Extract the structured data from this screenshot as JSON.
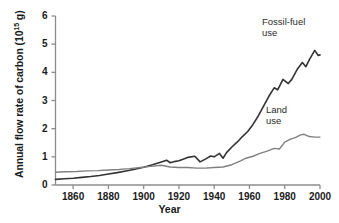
{
  "chart_data": {
    "type": "line",
    "title": "",
    "xlabel": "Year",
    "ylabel": "Annual flow rate of carbon (10",
    "ylabel_exponent": "15",
    "ylabel_suffix": " g)",
    "xlim": [
      1850,
      2000
    ],
    "ylim": [
      0,
      6
    ],
    "grid": false,
    "legend_position": "inline-annotations",
    "xticks": [
      1860,
      1880,
      1900,
      1920,
      1940,
      1960,
      1980,
      2000
    ],
    "xtick_labels": [
      "1860",
      "1880",
      "1900",
      "1920",
      "1940",
      "1960",
      "1980",
      "2000"
    ],
    "yticks": [
      0,
      1,
      2,
      3,
      4,
      5,
      6
    ],
    "ytick_labels": [
      "0",
      "1",
      "2",
      "3",
      "4",
      "5",
      "6"
    ],
    "series": [
      {
        "name": "Fossil-fuel use",
        "color": "#333333",
        "annotation": "Fossil-fuel\nuse",
        "x": [
          1850,
          1855,
          1860,
          1865,
          1870,
          1875,
          1880,
          1885,
          1890,
          1895,
          1900,
          1905,
          1910,
          1913,
          1915,
          1918,
          1920,
          1925,
          1929,
          1932,
          1935,
          1938,
          1940,
          1943,
          1945,
          1947,
          1950,
          1953,
          1956,
          1959,
          1962,
          1965,
          1968,
          1971,
          1974,
          1976,
          1979,
          1982,
          1984,
          1987,
          1990,
          1992,
          1994,
          1997,
          1999,
          2000
        ],
        "y": [
          0.2,
          0.22,
          0.24,
          0.27,
          0.3,
          0.34,
          0.39,
          0.44,
          0.5,
          0.56,
          0.63,
          0.72,
          0.82,
          0.88,
          0.79,
          0.84,
          0.86,
          0.98,
          1.02,
          0.82,
          0.92,
          1.03,
          1.0,
          1.12,
          0.95,
          1.15,
          1.35,
          1.52,
          1.72,
          1.9,
          2.15,
          2.45,
          2.8,
          3.15,
          3.45,
          3.38,
          3.75,
          3.6,
          3.75,
          4.1,
          4.35,
          4.2,
          4.45,
          4.78,
          4.6,
          4.62
        ]
      },
      {
        "name": "Land use",
        "color": "#808080",
        "annotation": "Land\nuse",
        "x": [
          1850,
          1856,
          1862,
          1868,
          1874,
          1880,
          1886,
          1892,
          1898,
          1904,
          1910,
          1915,
          1920,
          1925,
          1930,
          1935,
          1940,
          1945,
          1950,
          1955,
          1958,
          1962,
          1966,
          1970,
          1974,
          1977,
          1980,
          1983,
          1986,
          1989,
          1991,
          1994,
          1997,
          2000
        ],
        "y": [
          0.45,
          0.47,
          0.48,
          0.5,
          0.51,
          0.53,
          0.55,
          0.58,
          0.62,
          0.66,
          0.7,
          0.64,
          0.62,
          0.62,
          0.6,
          0.6,
          0.62,
          0.64,
          0.72,
          0.86,
          0.95,
          1.02,
          1.12,
          1.2,
          1.3,
          1.28,
          1.52,
          1.62,
          1.68,
          1.78,
          1.8,
          1.72,
          1.7,
          1.7
        ]
      }
    ]
  }
}
